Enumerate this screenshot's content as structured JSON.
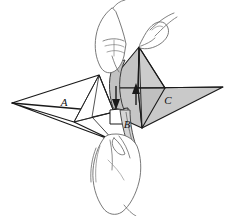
{
  "figure": {
    "background_color": "#ffffff",
    "ink_color": "#1a1a1a"
  },
  "labels": {
    "left_wing": "A",
    "center_flap": "B",
    "right_wing": "C"
  },
  "label_positions": {
    "left_wing": {
      "x": 64,
      "y": 106
    },
    "center_flap": {
      "x": 127,
      "y": 128
    },
    "right_wing": {
      "x": 168,
      "y": 104
    }
  },
  "shapes": {
    "left_wing": {
      "name": "left-wing-panel",
      "fill": "#ffffff",
      "stroke": "#1a1a1a"
    },
    "right_wing": {
      "name": "right-wing-panel",
      "fill": "#c9c9c9",
      "stroke": "#1a1a1a"
    },
    "center_flap": {
      "name": "center-flap-panel",
      "fill": "#c2c2c2",
      "stroke": "#1a1a1a"
    },
    "hands": {
      "name": "hands-outline",
      "fill": "#ffffff",
      "stroke": "#555555"
    }
  },
  "arrows": [
    {
      "name": "down-arrow",
      "direction": "down",
      "head_x": 116,
      "head_y": 108,
      "tail_x": 116,
      "tail_y": 88,
      "color": "#1a1a1a"
    },
    {
      "name": "up-arrow",
      "direction": "up",
      "head_x": 136,
      "head_y": 86,
      "tail_x": 136,
      "tail_y": 106,
      "color": "#1a1a1a"
    }
  ],
  "chart_data": {
    "type": "diagram",
    "elements": [
      {
        "id": "A",
        "role": "left wing panel",
        "shaded": false
      },
      {
        "id": "B",
        "role": "center flap being folded",
        "shaded": true
      },
      {
        "id": "C",
        "role": "right wing panel",
        "shaded": true
      }
    ],
    "motions": [
      {
        "label": "down-arrow",
        "direction": "down"
      },
      {
        "label": "up-arrow",
        "direction": "up"
      }
    ]
  }
}
